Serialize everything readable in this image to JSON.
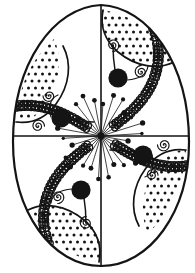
{
  "artwork": {
    "title": "Decorative Easter Egg (Pysanka) Line Art",
    "subject": "easter-egg-ornament",
    "style": "black-and-white coloring-book line art",
    "background_color": "#ffffff",
    "ink_color": "#141414",
    "canvas": {
      "width": 195,
      "height": 273
    }
  },
  "egg_outline": {
    "name": "egg-silhouette",
    "center_x": 101,
    "center_y": 136,
    "radius_x": 88,
    "radius_y_top": 132,
    "radius_y_bottom": 130,
    "top_narrowing": 0.78,
    "stroke_width": 2.2,
    "path": "M 101 5 C 148 7 189 63 189 142 C 189 212 150 266 101 266 C 52 266 13 212 13 142 C 13 63 54 7 101 5 Z"
  },
  "axes": [
    {
      "name": "vertical-axis-line",
      "x1": 101,
      "y1": 5,
      "x2": 101,
      "y2": 266,
      "stroke_width": 1.6
    },
    {
      "name": "horizontal-axis-line",
      "x1": 14,
      "y1": 136,
      "x2": 188,
      "y2": 136,
      "stroke_width": 1.6
    }
  ],
  "braid_bands": [
    {
      "name": "braid-band-upper-left",
      "angle_deg": 212,
      "inner_radius": 16,
      "outer_radius": 122,
      "curl": -26,
      "width": 7.5,
      "loops": 30
    },
    {
      "name": "braid-band-upper-right",
      "angle_deg": 322,
      "inner_radius": 16,
      "outer_radius": 120,
      "curl": -26,
      "width": 7.5,
      "loops": 28
    },
    {
      "name": "braid-band-lower-right",
      "angle_deg": 32,
      "inner_radius": 16,
      "outer_radius": 122,
      "curl": -26,
      "width": 7.5,
      "loops": 30
    },
    {
      "name": "braid-band-lower-left",
      "angle_deg": 142,
      "inner_radius": 16,
      "outer_radius": 120,
      "curl": -26,
      "width": 7.5,
      "loops": 28
    }
  ],
  "dotted_fans": [
    {
      "name": "dotted-fan-top-right",
      "quadrant": "top-right",
      "dot_radius": 1.5,
      "dot_spacing": 7,
      "dot_count": 58,
      "region_path": "M 103 10 C 130 14 157 32 172 60 C 150 72 122 62 106 41 C 101 32 100 20 103 10 Z"
    },
    {
      "name": "dotted-fan-right-lower",
      "quadrant": "right-lower",
      "dot_radius": 1.5,
      "dot_spacing": 7,
      "dot_count": 54,
      "region_path": "M 186 150 C 184 186 170 214 148 233 C 138 212 143 183 159 163 C 167 154 177 150 186 150 Z"
    },
    {
      "name": "dotted-fan-bottom-left",
      "quadrant": "bottom-left",
      "dot_radius": 1.5,
      "dot_spacing": 7,
      "dot_count": 58,
      "region_path": "M 99 262 C 72 258 45 240 30 212 C 52 200 80 210 96 231 C 101 240 102 252 99 262 Z"
    },
    {
      "name": "dotted-fan-left-upper",
      "quadrant": "left-upper",
      "dot_radius": 1.5,
      "dot_spacing": 7,
      "dot_count": 54,
      "region_path": "M 16 122 C 18 86 32 58 54 39 C 64 60 59 89 43 109 C 35 118 25 122 16 122 Z"
    }
  ],
  "fan_arcs": [
    {
      "name": "fan-arc-top-right",
      "path": "M 103 10 C 100 26 104 40 118 52 C 136 67 158 70 174 62"
    },
    {
      "name": "fan-arc-right-lower",
      "path": "M 186 150 C 171 148 157 153 146 168 C 132 187 130 209 139 226"
    },
    {
      "name": "fan-arc-bottom-left",
      "path": "M 99 262 C 102 246 98 232 84 220 C 66 205 44 202 28 210"
    },
    {
      "name": "fan-arc-left-upper",
      "path": "M 16 122 C 31 124 45 119 56 104 C 70 85 72 63 63 46"
    }
  ],
  "black_disks": [
    {
      "name": "black-disk-top-right",
      "cx": 118,
      "cy": 78,
      "r": 9.6
    },
    {
      "name": "black-disk-right",
      "cx": 143,
      "cy": 155,
      "r": 9.6
    },
    {
      "name": "black-disk-bottom-left",
      "cx": 81,
      "cy": 190,
      "r": 9.6
    },
    {
      "name": "black-disk-left",
      "cx": 61,
      "cy": 118,
      "r": 9.6
    }
  ],
  "disk_stems": [
    {
      "name": "stem-top-right",
      "path": "M 115 70 C 113 58 113 50 113 45"
    },
    {
      "name": "stem-right",
      "path": "M 135 152 C 123 150 115 150 110 150"
    },
    {
      "name": "stem-bottom-left",
      "path": "M 84 198 C 86 210 86 218 86 223"
    },
    {
      "name": "stem-left",
      "path": "M 69 120 C 81 122 89 122 94 122"
    }
  ],
  "spirals": [
    {
      "name": "spiral-top-right-upper",
      "cx": 113,
      "cy": 45,
      "turns": 2.2,
      "max_r": 6.5,
      "rotation": 20
    },
    {
      "name": "spiral-top-right-lower",
      "cx": 141,
      "cy": 72,
      "turns": 2.2,
      "max_r": 6.5,
      "rotation": 200
    },
    {
      "name": "spiral-right-inner",
      "cx": 164,
      "cy": 145,
      "turns": 2.2,
      "max_r": 6.5,
      "rotation": 110
    },
    {
      "name": "spiral-right-lower",
      "cx": 152,
      "cy": 175,
      "turns": 2.2,
      "max_r": 6.0,
      "rotation": 290
    },
    {
      "name": "spiral-bottom-left-lower",
      "cx": 86,
      "cy": 223,
      "turns": 2.2,
      "max_r": 6.5,
      "rotation": 200
    },
    {
      "name": "spiral-bottom-left-upper",
      "cx": 58,
      "cy": 197,
      "turns": 2.2,
      "max_r": 6.5,
      "rotation": 20
    },
    {
      "name": "spiral-left-inner",
      "cx": 38,
      "cy": 126,
      "turns": 2.2,
      "max_r": 6.5,
      "rotation": 290
    },
    {
      "name": "spiral-left-upper",
      "cx": 49,
      "cy": 96,
      "turns": 2.2,
      "max_r": 6.0,
      "rotation": 110
    }
  ],
  "center_burst": {
    "name": "center-starburst",
    "cx": 101,
    "cy": 136,
    "ray_count": 26,
    "min_length": 14,
    "max_length": 44,
    "tip_dot_radius": 2.2,
    "stroke_width": 0.8
  },
  "tendril_curves": [
    {
      "name": "tendril-top-right",
      "path": "M 127 80 C 140 79 147 74 148 66"
    },
    {
      "name": "tendril-right",
      "path": "M 152 155 C 155 167 152 174 145 177"
    },
    {
      "name": "tendril-bottom-left",
      "path": "M 72 189 C 59 190 52 195 51 203"
    },
    {
      "name": "tendril-left",
      "path": "M 51 117 C 48 105 51 98 58 95"
    }
  ]
}
